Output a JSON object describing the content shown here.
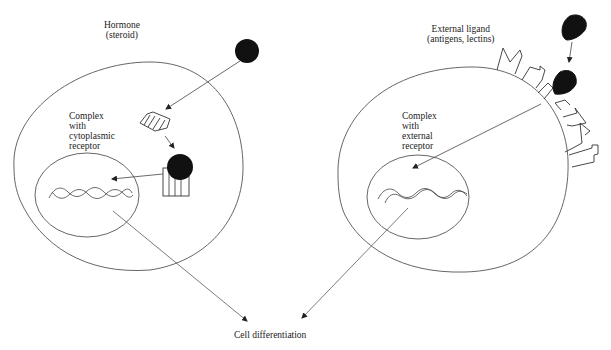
{
  "diagram": {
    "left_panel": {
      "hormone_label": [
        "Hormone",
        "(steroid)"
      ],
      "complex_label": [
        "Complex",
        "with",
        "cytoplasmic",
        "receptor"
      ]
    },
    "right_panel": {
      "ligand_label": [
        "External  ligand",
        "(antigens, lectins)"
      ],
      "complex_label": [
        "Complex",
        "with",
        "external",
        "receptor"
      ]
    },
    "outcome_label": "Cell differentiation",
    "colors": {
      "line": "#444444",
      "fill_dark": "#111111",
      "background": "#ffffff"
    },
    "icons": [
      "steroid-hormone-molecule",
      "cytoplasmic-receptor",
      "hormone-receptor-complex",
      "dna-double-helix",
      "external-ligand-molecule",
      "membrane-receptor",
      "arrow"
    ]
  }
}
